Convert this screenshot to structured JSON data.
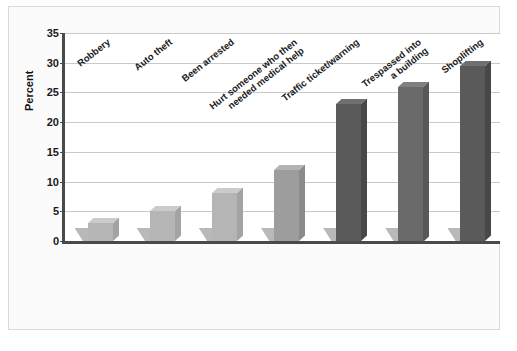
{
  "chart_data": {
    "type": "bar",
    "title": "",
    "subtitle": "",
    "xlabel": "",
    "ylabel": "Percent",
    "ylim": [
      0,
      35
    ],
    "ytick_step": 5,
    "yticks": [
      "0",
      "5",
      "10",
      "15",
      "20",
      "25",
      "30",
      "35"
    ],
    "grid": true,
    "legend": "none",
    "categories": [
      "Robbery",
      "Auto theft",
      "Been arrested",
      "Hurt someone who then\nneeded medical help",
      "Traffic ticket/warning",
      "Trespassed into\na building",
      "Shoplifting"
    ],
    "values": [
      3,
      5,
      8,
      12,
      23,
      26,
      29.5
    ],
    "bar_colors": [
      "#b5b5b5",
      "#b5b5b5",
      "#b5b5b5",
      "#9d9d9d",
      "#5a5a5a",
      "#6a6a6a",
      "#5a5a5a"
    ]
  },
  "style": {
    "plot_background": "#ffffff",
    "figure_background": "#fbfbfb",
    "grid_color": "#c9c9c9",
    "axis_color": "#4a4a4a",
    "text_color": "#1a1a1a"
  }
}
